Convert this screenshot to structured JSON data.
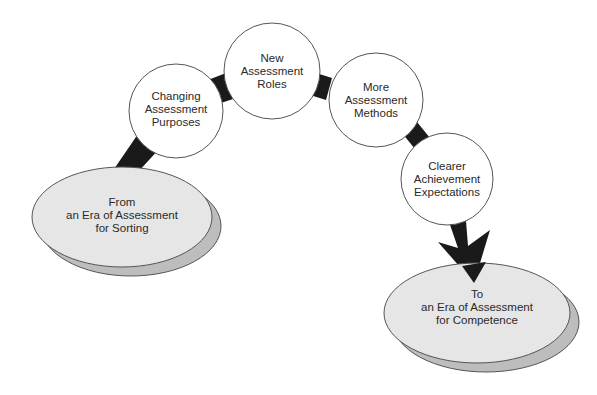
{
  "colors": {
    "background": "#ffffff",
    "connector": "#1a1a1a",
    "circle_fill": "#ffffff",
    "circle_stroke": "#555555",
    "ellipse_fill": "#e6e6e6",
    "ellipse_shadow": "#bdbdbd",
    "text": "#2a2a2a"
  },
  "start": {
    "lines": [
      "From",
      "an Era of Assessment",
      "for Sorting"
    ]
  },
  "steps": [
    {
      "lines": [
        "Changing",
        "Assessment",
        "Purposes"
      ]
    },
    {
      "lines": [
        "New",
        "Assessment",
        "Roles"
      ]
    },
    {
      "lines": [
        "More",
        "Assessment",
        "Methods"
      ]
    },
    {
      "lines": [
        "Clearer",
        "Achievement",
        "Expectations"
      ]
    }
  ],
  "end": {
    "lines": [
      "To",
      "an Era of Assessment",
      "for Competence"
    ]
  }
}
